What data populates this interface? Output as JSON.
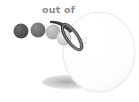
{
  "illustration": {
    "title": "out of",
    "background_color": "#ffffff",
    "caption": {
      "text": "out of",
      "color": "#8a8a8a",
      "x": 42,
      "y": 13
    },
    "big_circle": {
      "name": "large-white-sphere",
      "outline_color": "#ededed",
      "fill_color": "#ffffff",
      "cx": 99,
      "cy": 52,
      "rx": 36,
      "ry": 40
    },
    "shadow": {
      "name": "ground-shadow",
      "color": "#b8b8b8",
      "cx": 71,
      "cy": 82,
      "rx": 28,
      "ry": 7
    },
    "ring": {
      "name": "tilted-ring",
      "color": "#4a4a4a",
      "cx": 72,
      "cy": 37,
      "rx": 6,
      "ry": 15,
      "rotation": -35
    },
    "swoosh": {
      "name": "motion-swoosh",
      "color": "#3c3c3c"
    },
    "sparkles": {
      "name": "impact-sparkles",
      "color": "#9a9a9a",
      "count": 4
    },
    "spheres": [
      {
        "label": "ball-1",
        "cx": 21,
        "cy": 31,
        "r": 7.5,
        "color": "#4d4d4d",
        "highlight": "#6e6e6e"
      },
      {
        "label": "ball-2",
        "cx": 38,
        "cy": 30,
        "r": 7.5,
        "color": "#6b6b6b",
        "highlight": "#8d8d8d"
      },
      {
        "label": "ball-3",
        "cx": 53,
        "cy": 32,
        "r": 7.5,
        "color": "#adadad",
        "highlight": "#c9c9c9"
      },
      {
        "label": "ball-4",
        "cx": 64,
        "cy": 38,
        "r": 7.5,
        "color": "#c9c9c9",
        "highlight": "#e2e2e2"
      }
    ]
  }
}
